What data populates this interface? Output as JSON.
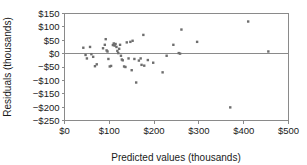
{
  "chart_data": {
    "type": "scatter",
    "title": "",
    "xlabel": "Predicted values (thousands)",
    "ylabel": "Residuals (thousands)",
    "xlim": [
      0,
      500
    ],
    "ylim": [
      -250,
      150
    ],
    "xticks": [
      0,
      100,
      200,
      300,
      400,
      500
    ],
    "yticks": [
      150,
      100,
      50,
      0,
      -50,
      -100,
      -150,
      -200,
      -250
    ],
    "xticklabels": [
      "$0",
      "$100",
      "$200",
      "$300",
      "$400",
      "$500"
    ],
    "yticklabels": [
      "$150",
      "$100",
      "$50",
      "$0",
      "−$50",
      "−$100",
      "−$150",
      "−$200",
      "−$250"
    ],
    "grid": false,
    "legend": false,
    "reference_line": {
      "orientation": "horizontal",
      "value": 0,
      "color": "#8a8a8a"
    },
    "marker": {
      "shape": "square",
      "size": 2.4,
      "color": "#6e6e6e"
    },
    "points": [
      {
        "x": 42,
        "y": 22
      },
      {
        "x": 47,
        "y": -5
      },
      {
        "x": 50,
        "y": -18
      },
      {
        "x": 57,
        "y": 25
      },
      {
        "x": 60,
        "y": -2
      },
      {
        "x": 64,
        "y": -12
      },
      {
        "x": 68,
        "y": -47
      },
      {
        "x": 72,
        "y": -40
      },
      {
        "x": 86,
        "y": 20
      },
      {
        "x": 90,
        "y": 33
      },
      {
        "x": 92,
        "y": 54
      },
      {
        "x": 94,
        "y": 12
      },
      {
        "x": 96,
        "y": 8
      },
      {
        "x": 98,
        "y": -20
      },
      {
        "x": 101,
        "y": -48
      },
      {
        "x": 104,
        "y": -46
      },
      {
        "x": 108,
        "y": 32
      },
      {
        "x": 110,
        "y": 38
      },
      {
        "x": 112,
        "y": 30
      },
      {
        "x": 114,
        "y": 36
      },
      {
        "x": 116,
        "y": 25
      },
      {
        "x": 118,
        "y": 10
      },
      {
        "x": 120,
        "y": 2
      },
      {
        "x": 122,
        "y": 18
      },
      {
        "x": 124,
        "y": 33
      },
      {
        "x": 126,
        "y": -8
      },
      {
        "x": 128,
        "y": -22
      },
      {
        "x": 130,
        "y": -25
      },
      {
        "x": 133,
        "y": -48
      },
      {
        "x": 136,
        "y": -50
      },
      {
        "x": 139,
        "y": 42
      },
      {
        "x": 143,
        "y": -18
      },
      {
        "x": 147,
        "y": 44
      },
      {
        "x": 150,
        "y": -62
      },
      {
        "x": 152,
        "y": 48
      },
      {
        "x": 156,
        "y": -20
      },
      {
        "x": 160,
        "y": -108
      },
      {
        "x": 166,
        "y": -26
      },
      {
        "x": 170,
        "y": -18
      },
      {
        "x": 172,
        "y": -42
      },
      {
        "x": 176,
        "y": 70
      },
      {
        "x": 178,
        "y": -45
      },
      {
        "x": 186,
        "y": -24
      },
      {
        "x": 198,
        "y": -34
      },
      {
        "x": 219,
        "y": -70
      },
      {
        "x": 228,
        "y": -8
      },
      {
        "x": 243,
        "y": 33
      },
      {
        "x": 255,
        "y": 2
      },
      {
        "x": 258,
        "y": 0
      },
      {
        "x": 261,
        "y": 90
      },
      {
        "x": 296,
        "y": 44
      },
      {
        "x": 370,
        "y": -201
      },
      {
        "x": 410,
        "y": 120
      },
      {
        "x": 455,
        "y": 8
      }
    ]
  }
}
